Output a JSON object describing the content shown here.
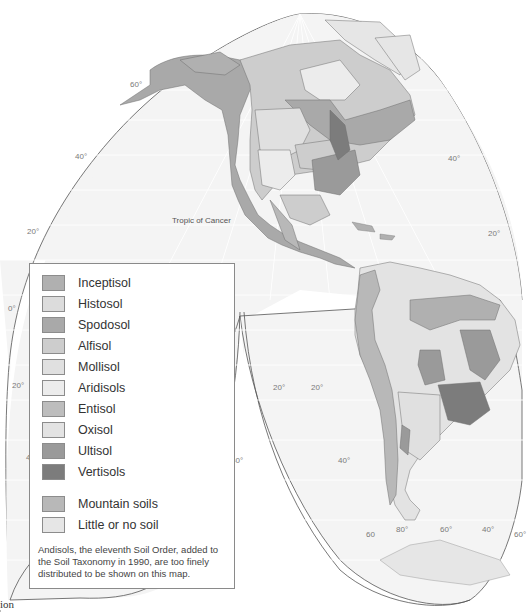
{
  "map": {
    "title": "Soil orders of the Americas",
    "projection": "Goode homolosine (interrupted)",
    "annotations": {
      "tropic_of_cancer": "Tropic of Cancer"
    },
    "latitude_labels": {
      "left": [
        "60°",
        "40°",
        "20°",
        "0°",
        "20°",
        "40"
      ],
      "right": [
        "40°",
        "20°"
      ],
      "south_left_lobe": [
        "20°",
        "40°"
      ],
      "south_right_lobe": [
        "20°",
        "40°"
      ],
      "bottom": [
        "60",
        "80°",
        "60°",
        "40°",
        "60°"
      ]
    },
    "colors": {
      "ocean": "#f4f4f4",
      "grid": "#ffffff",
      "outline": "#555555"
    }
  },
  "legend": {
    "items": [
      {
        "label": "Inceptisol",
        "color": "#b0b0b0"
      },
      {
        "label": "Histosol",
        "color": "#dcdcdc"
      },
      {
        "label": "Spodosol",
        "color": "#a9a9a9"
      },
      {
        "label": "Alfisol",
        "color": "#cdcdcd"
      },
      {
        "label": "Mollisol",
        "color": "#e0e0e0"
      },
      {
        "label": "Aridisols",
        "color": "#ececec"
      },
      {
        "label": "Entisol",
        "color": "#bdbdbd"
      },
      {
        "label": "Oxisol",
        "color": "#e3e3e3"
      },
      {
        "label": "Ultisol",
        "color": "#9a9a9a"
      },
      {
        "label": "Vertisols",
        "color": "#7c7c7c"
      }
    ],
    "extra_items": [
      {
        "label": "Mountain soils",
        "color": "#b8b8b8"
      },
      {
        "label": "Little or no soil",
        "color": "#e6e6e6"
      }
    ],
    "note": "Andisols, the eleventh Soil Order, added to the Soil Taxonomy in 1990, are too finely distributed to be shown on this map."
  },
  "corner_text": "ion"
}
